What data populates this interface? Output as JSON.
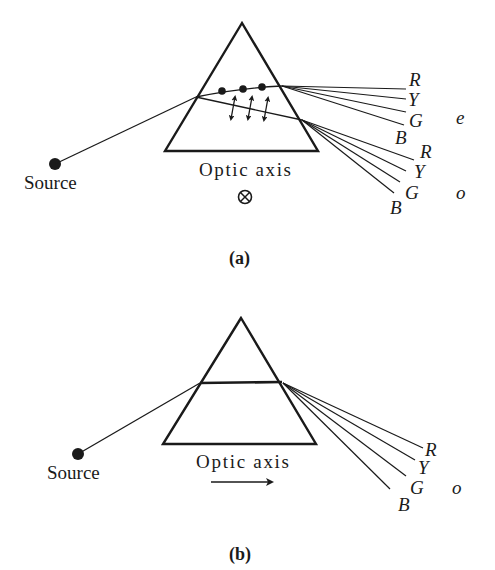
{
  "figure": {
    "panel_a": {
      "caption": "(a)",
      "source_label": "Source",
      "axis_label": "Optic axis",
      "axis_symbol": "⊗",
      "upper_beam": {
        "name": "e",
        "colors": [
          "R",
          "Y",
          "G",
          "B"
        ]
      },
      "lower_beam": {
        "name": "o",
        "colors": [
          "R",
          "Y",
          "G",
          "B"
        ]
      }
    },
    "panel_b": {
      "caption": "(b)",
      "source_label": "Source",
      "axis_label": "Optic axis",
      "axis_symbol": "→",
      "beam": {
        "name": "o",
        "colors": [
          "R",
          "Y",
          "G",
          "B"
        ]
      }
    }
  }
}
